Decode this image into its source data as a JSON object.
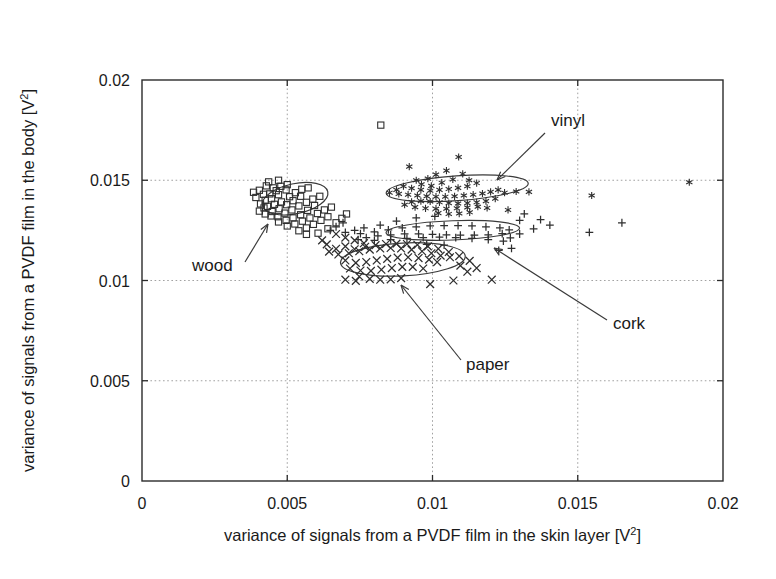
{
  "figure": {
    "title": "",
    "background": "#ffffff",
    "ink_color": "#2f2f2f"
  },
  "axes": {
    "x_title_main": "variance of signals from a PVDF film in the skin layer [V",
    "x_title_sup": "2",
    "x_title_tail": "]",
    "y_title_main": "variance of signals from a PVDF film in the body [V",
    "y_title_sup": "2",
    "y_title_tail": "]",
    "x_ticklabels": [
      "0",
      "0.005",
      "0.01",
      "0.015",
      "0.02"
    ],
    "y_ticklabels": [
      "0",
      "0.005",
      "0.01",
      "0.015",
      "0.02"
    ]
  },
  "annotations": [
    {
      "name": "wood",
      "label": "wood",
      "label_x": 192,
      "label_y": 271,
      "tip_x": 268,
      "tip_y": 224,
      "tail_x": 245,
      "tail_y": 262
    },
    {
      "name": "vinyl",
      "label": "vinyl",
      "label_x": 551,
      "label_y": 126,
      "tip_x": 497,
      "tip_y": 180,
      "tail_x": 545,
      "tail_y": 133
    },
    {
      "name": "cork",
      "label": "cork",
      "label_x": 613,
      "label_y": 329,
      "tip_x": 494,
      "tip_y": 248,
      "tail_x": 607,
      "tail_y": 320
    },
    {
      "name": "paper",
      "label": "paper",
      "label_x": 466,
      "label_y": 370,
      "tip_x": 401,
      "tip_y": 285,
      "tail_x": 461,
      "tail_y": 360
    }
  ],
  "chart_data": {
    "type": "scatter",
    "title": "",
    "xlabel": "variance of signals from a PVDF film in the skin layer [V^2]",
    "ylabel": "variance of signals from a PVDF film in the body [V^2]",
    "xlim": [
      0,
      0.02
    ],
    "ylim": [
      0,
      0.02
    ],
    "xticks": [
      0,
      0.005,
      0.01,
      0.015,
      0.02
    ],
    "yticks": [
      0,
      0.005,
      0.01,
      0.015,
      0.02
    ],
    "grid": true,
    "legend": "none (inline arrow annotations)",
    "cluster_ellipses": [
      {
        "name": "wood",
        "cx": 0.00527,
        "cy": 0.01408,
        "rx": 0.00115,
        "ry": 0.00075,
        "angle": -12
      },
      {
        "name": "vinyl",
        "cx": 0.01085,
        "cy": 0.0146,
        "rx": 0.00245,
        "ry": 0.00062,
        "angle": -4
      },
      {
        "name": "cork",
        "cx": 0.0107,
        "cy": 0.0125,
        "rx": 0.0023,
        "ry": 0.00048,
        "angle": -2
      },
      {
        "name": "paper",
        "cx": 0.00898,
        "cy": 0.01105,
        "rx": 0.00215,
        "ry": 0.00082,
        "angle": -3
      }
    ],
    "series": [
      {
        "name": "wood",
        "marker": "square",
        "points": [
          [
            0.00822,
            0.01775
          ],
          [
            0.00404,
            0.0145
          ],
          [
            0.00428,
            0.01472
          ],
          [
            0.00452,
            0.01462
          ],
          [
            0.00418,
            0.0143
          ],
          [
            0.0044,
            0.01432
          ],
          [
            0.00462,
            0.01448
          ],
          [
            0.00478,
            0.0147
          ],
          [
            0.005,
            0.01478
          ],
          [
            0.00496,
            0.01452
          ],
          [
            0.0047,
            0.01428
          ],
          [
            0.00446,
            0.01408
          ],
          [
            0.00424,
            0.014
          ],
          [
            0.00408,
            0.01382
          ],
          [
            0.00432,
            0.0137
          ],
          [
            0.00456,
            0.0138
          ],
          [
            0.0048,
            0.01392
          ],
          [
            0.00508,
            0.01418
          ],
          [
            0.00528,
            0.01438
          ],
          [
            0.0055,
            0.01455
          ],
          [
            0.00572,
            0.01462
          ],
          [
            0.00546,
            0.0142
          ],
          [
            0.0052,
            0.01398
          ],
          [
            0.00498,
            0.01378
          ],
          [
            0.00472,
            0.01358
          ],
          [
            0.00448,
            0.01344
          ],
          [
            0.00424,
            0.01332
          ],
          [
            0.00404,
            0.01346
          ],
          [
            0.0042,
            0.01362
          ],
          [
            0.00444,
            0.01322
          ],
          [
            0.00468,
            0.01318
          ],
          [
            0.00492,
            0.01336
          ],
          [
            0.00516,
            0.01352
          ],
          [
            0.0054,
            0.01372
          ],
          [
            0.00566,
            0.0139
          ],
          [
            0.00588,
            0.01406
          ],
          [
            0.00612,
            0.0142
          ],
          [
            0.00594,
            0.01374
          ],
          [
            0.0057,
            0.0135
          ],
          [
            0.00546,
            0.01328
          ],
          [
            0.0052,
            0.01312
          ],
          [
            0.00496,
            0.013
          ],
          [
            0.0047,
            0.01292
          ],
          [
            0.005,
            0.01272
          ],
          [
            0.00526,
            0.01282
          ],
          [
            0.00552,
            0.01296
          ],
          [
            0.00578,
            0.01312
          ],
          [
            0.00604,
            0.01334
          ],
          [
            0.00628,
            0.01352
          ],
          [
            0.00652,
            0.01366
          ],
          [
            0.0064,
            0.01318
          ],
          [
            0.00616,
            0.013
          ],
          [
            0.0059,
            0.0128
          ],
          [
            0.00566,
            0.01262
          ],
          [
            0.0054,
            0.01248
          ],
          [
            0.00566,
            0.0123
          ],
          [
            0.00606,
            0.01236
          ],
          [
            0.0064,
            0.01258
          ],
          [
            0.00668,
            0.01288
          ],
          [
            0.00688,
            0.0131
          ],
          [
            0.00704,
            0.01332
          ],
          [
            0.00384,
            0.0144
          ],
          [
            0.00392,
            0.01414
          ],
          [
            0.00436,
            0.01492
          ],
          [
            0.0047,
            0.015
          ]
        ]
      },
      {
        "name": "vinyl",
        "marker": "star",
        "points": [
          [
            0.0092,
            0.01568
          ],
          [
            0.0109,
            0.01616
          ],
          [
            0.01048,
            0.01548
          ],
          [
            0.00984,
            0.01508
          ],
          [
            0.01012,
            0.01528
          ],
          [
            0.01104,
            0.01532
          ],
          [
            0.0107,
            0.01504
          ],
          [
            0.01032,
            0.01488
          ],
          [
            0.00996,
            0.01472
          ],
          [
            0.00962,
            0.0148
          ],
          [
            0.00944,
            0.015
          ],
          [
            0.01126,
            0.015
          ],
          [
            0.01152,
            0.01486
          ],
          [
            0.0112,
            0.0147
          ],
          [
            0.01088,
            0.01462
          ],
          [
            0.01056,
            0.01456
          ],
          [
            0.01024,
            0.01452
          ],
          [
            0.00992,
            0.01448
          ],
          [
            0.0096,
            0.01452
          ],
          [
            0.00928,
            0.0146
          ],
          [
            0.009,
            0.0147
          ],
          [
            0.00876,
            0.01452
          ],
          [
            0.00852,
            0.01438
          ],
          [
            0.00884,
            0.01432
          ],
          [
            0.00916,
            0.01428
          ],
          [
            0.00948,
            0.01424
          ],
          [
            0.0098,
            0.0142
          ],
          [
            0.01012,
            0.01418
          ],
          [
            0.01044,
            0.01418
          ],
          [
            0.01076,
            0.0142
          ],
          [
            0.01108,
            0.01424
          ],
          [
            0.0114,
            0.01428
          ],
          [
            0.01172,
            0.01434
          ],
          [
            0.012,
            0.01442
          ],
          [
            0.01226,
            0.01452
          ],
          [
            0.01248,
            0.01438
          ],
          [
            0.01216,
            0.01408
          ],
          [
            0.01184,
            0.01396
          ],
          [
            0.01152,
            0.0139
          ],
          [
            0.0112,
            0.01386
          ],
          [
            0.01088,
            0.01384
          ],
          [
            0.01056,
            0.01386
          ],
          [
            0.01024,
            0.0139
          ],
          [
            0.00992,
            0.01394
          ],
          [
            0.0096,
            0.01396
          ],
          [
            0.00928,
            0.01392
          ],
          [
            0.00904,
            0.01378
          ],
          [
            0.0094,
            0.01366
          ],
          [
            0.00976,
            0.0136
          ],
          [
            0.01012,
            0.01358
          ],
          [
            0.01048,
            0.01358
          ],
          [
            0.01084,
            0.0136
          ],
          [
            0.0112,
            0.01364
          ],
          [
            0.01156,
            0.01368
          ],
          [
            0.01188,
            0.01362
          ],
          [
            0.0102,
            0.01336
          ],
          [
            0.01056,
            0.01332
          ],
          [
            0.01092,
            0.01334
          ],
          [
            0.01128,
            0.0134
          ],
          [
            0.01288,
            0.01444
          ],
          [
            0.01548,
            0.01424
          ],
          [
            0.01884,
            0.0149
          ],
          [
            0.01332,
            0.01442
          ],
          [
            0.0126,
            0.01352
          ]
        ]
      },
      {
        "name": "cork",
        "marker": "plus",
        "points": [
          [
            0.00944,
            0.01312
          ],
          [
            0.01008,
            0.0132
          ],
          [
            0.00876,
            0.01296
          ],
          [
            0.0082,
            0.01276
          ],
          [
            0.00764,
            0.01262
          ],
          [
            0.00732,
            0.0125
          ],
          [
            0.007,
            0.0124
          ],
          [
            0.00752,
            0.01234
          ],
          [
            0.008,
            0.01242
          ],
          [
            0.00848,
            0.01252
          ],
          [
            0.00896,
            0.01262
          ],
          [
            0.00944,
            0.01268
          ],
          [
            0.00992,
            0.01272
          ],
          [
            0.0104,
            0.01274
          ],
          [
            0.01088,
            0.01274
          ],
          [
            0.01136,
            0.01272
          ],
          [
            0.01184,
            0.01268
          ],
          [
            0.01232,
            0.01262
          ],
          [
            0.01264,
            0.01252
          ],
          [
            0.0124,
            0.01234
          ],
          [
            0.01192,
            0.01228
          ],
          [
            0.01144,
            0.01226
          ],
          [
            0.01096,
            0.01226
          ],
          [
            0.01048,
            0.01228
          ],
          [
            0.01,
            0.0123
          ],
          [
            0.00952,
            0.01232
          ],
          [
            0.00904,
            0.01232
          ],
          [
            0.00856,
            0.01228
          ],
          [
            0.00812,
            0.01222
          ],
          [
            0.00772,
            0.01214
          ],
          [
            0.00744,
            0.01204
          ],
          [
            0.008,
            0.012
          ],
          [
            0.00856,
            0.01204
          ],
          [
            0.00912,
            0.0121
          ],
          [
            0.00968,
            0.01214
          ],
          [
            0.01024,
            0.01216
          ],
          [
            0.0108,
            0.01214
          ],
          [
            0.01136,
            0.0121
          ],
          [
            0.01192,
            0.01204
          ],
          [
            0.01244,
            0.01196
          ],
          [
            0.013,
            0.013
          ],
          [
            0.01316,
            0.01332
          ],
          [
            0.01372,
            0.01304
          ],
          [
            0.01404,
            0.01276
          ],
          [
            0.01348,
            0.01258
          ],
          [
            0.013,
            0.01232
          ],
          [
            0.01268,
            0.01212
          ],
          [
            0.0154,
            0.0124
          ],
          [
            0.01652,
            0.01288
          ],
          [
            0.01272,
            0.0116
          ],
          [
            0.01228,
            0.0115
          ],
          [
            0.00692,
            0.01288
          ],
          [
            0.00668,
            0.01268
          ],
          [
            0.00648,
            0.0125
          ],
          [
            0.0098,
            0.0118
          ],
          [
            0.0104,
            0.01176
          ]
        ]
      },
      {
        "name": "paper",
        "marker": "cross",
        "points": [
          [
            0.00668,
            0.01232
          ],
          [
            0.007,
            0.01214
          ],
          [
            0.00732,
            0.012
          ],
          [
            0.00764,
            0.01186
          ],
          [
            0.007,
            0.0117
          ],
          [
            0.00668,
            0.01158
          ],
          [
            0.00644,
            0.01144
          ],
          [
            0.00676,
            0.0113
          ],
          [
            0.00712,
            0.01136
          ],
          [
            0.00748,
            0.01146
          ],
          [
            0.00784,
            0.01154
          ],
          [
            0.0082,
            0.0116
          ],
          [
            0.00856,
            0.01162
          ],
          [
            0.00892,
            0.0116
          ],
          [
            0.00928,
            0.01154
          ],
          [
            0.00964,
            0.01146
          ],
          [
            0.00996,
            0.01136
          ],
          [
            0.01028,
            0.01124
          ],
          [
            0.0106,
            0.01116
          ],
          [
            0.01092,
            0.01122
          ],
          [
            0.01056,
            0.01142
          ],
          [
            0.0102,
            0.01158
          ],
          [
            0.00984,
            0.0117
          ],
          [
            0.00948,
            0.01178
          ],
          [
            0.00912,
            0.01182
          ],
          [
            0.00876,
            0.01184
          ],
          [
            0.0084,
            0.01182
          ],
          [
            0.00804,
            0.01176
          ],
          [
            0.00768,
            0.01168
          ],
          [
            0.00732,
            0.01156
          ],
          [
            0.007,
            0.011
          ],
          [
            0.00736,
            0.01088
          ],
          [
            0.00772,
            0.01092
          ],
          [
            0.00808,
            0.011
          ],
          [
            0.00844,
            0.01108
          ],
          [
            0.0088,
            0.01114
          ],
          [
            0.00916,
            0.01116
          ],
          [
            0.00952,
            0.01112
          ],
          [
            0.00988,
            0.01104
          ],
          [
            0.01016,
            0.01092
          ],
          [
            0.00716,
            0.0106
          ],
          [
            0.00752,
            0.0105
          ],
          [
            0.00788,
            0.01048
          ],
          [
            0.00824,
            0.01054
          ],
          [
            0.0086,
            0.01062
          ],
          [
            0.00896,
            0.01068
          ],
          [
            0.00932,
            0.01068
          ],
          [
            0.00968,
            0.0106
          ],
          [
            0.00748,
            0.0102
          ],
          [
            0.00784,
            0.01008
          ],
          [
            0.0082,
            0.01004
          ],
          [
            0.00856,
            0.01006
          ],
          [
            0.00892,
            0.01012
          ],
          [
            0.007,
            0.01004
          ],
          [
            0.00736,
            0.00998
          ],
          [
            0.01072,
            0.01
          ],
          [
            0.01204,
            0.01004
          ],
          [
            0.00992,
            0.00982
          ],
          [
            0.0112,
            0.01044
          ],
          [
            0.01152,
            0.01062
          ],
          [
            0.01128,
            0.01098
          ],
          [
            0.01096,
            0.01074
          ],
          [
            0.00636,
            0.0118
          ],
          [
            0.0062,
            0.012
          ]
        ]
      }
    ]
  }
}
